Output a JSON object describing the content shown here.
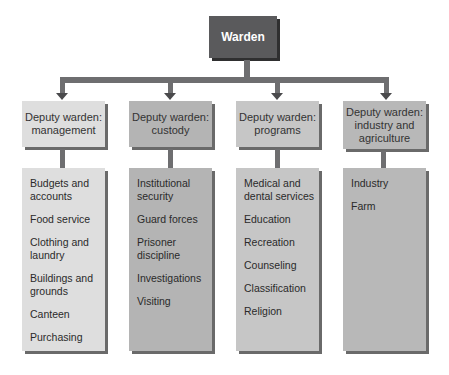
{
  "root": {
    "label": "Warden"
  },
  "colors": {
    "root_fill": "#5a5a5c",
    "connector": "#6e6e70",
    "col1_fill": "#dedede",
    "col2_fill": "#b4b4b4",
    "col3_fill": "#c6c6c6",
    "col4_fill": "#b8b8b8"
  },
  "columns": [
    {
      "header": "Deputy warden: management",
      "items": [
        "Budgets and accounts",
        "Food service",
        "Clothing and laundry",
        "Buildings and grounds",
        "Canteen",
        "Purchasing"
      ]
    },
    {
      "header": "Deputy warden: custody",
      "items": [
        "Institutional security",
        "Guard forces",
        "Prisoner discipline",
        "Investigations",
        "Visiting"
      ]
    },
    {
      "header": "Deputy warden: programs",
      "items": [
        "Medical and dental services",
        "Education",
        "Recreation",
        "Counseling",
        "Classification",
        "Religion"
      ]
    },
    {
      "header": "Deputy warden: industry and agriculture",
      "items": [
        "Industry",
        "Farm"
      ]
    }
  ]
}
